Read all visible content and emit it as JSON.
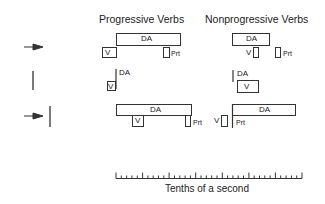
{
  "headers": {
    "progressive": "Progressive Verbs",
    "nonprogressive": "Nonprogressive Verbs"
  },
  "labels": {
    "da": "DA",
    "v": "V",
    "prt": "Prt"
  },
  "rows": [
    {
      "marker": "arrow"
    },
    {
      "marker": "bar"
    },
    {
      "marker": "arrow-bar"
    }
  ],
  "axis": {
    "label": "Tenths of a second",
    "minor_ticks": 35,
    "major_every": 5
  },
  "colors": {
    "stroke": "#333333",
    "background": "#ffffff"
  }
}
